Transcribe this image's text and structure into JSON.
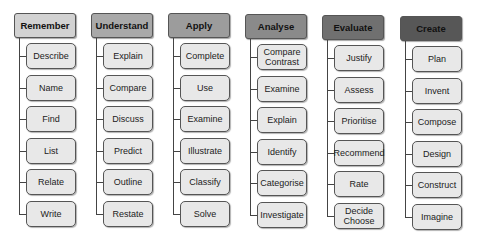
{
  "diagram": {
    "type": "hierarchy",
    "columns": [
      {
        "title": "Remember",
        "color": "#d2d2d2",
        "x": 14,
        "y": 13,
        "items": [
          "Describe",
          "Name",
          "Find",
          "List",
          "Relate",
          "Write"
        ]
      },
      {
        "title": "Understand",
        "color": "#a9a9a9",
        "x": 91,
        "y": 13,
        "items": [
          "Explain",
          "Compare",
          "Discuss",
          "Predict",
          "Outline",
          "Restate"
        ]
      },
      {
        "title": "Apply",
        "color": "#9c9c9c",
        "x": 168,
        "y": 13,
        "items": [
          "Complete",
          "Use",
          "Examine",
          "Illustrate",
          "Classify",
          "Solve"
        ]
      },
      {
        "title": "Analyse",
        "color": "#8a8a8a",
        "x": 245,
        "y": 14,
        "items": [
          "Compare\nContrast",
          "Examine",
          "Explain",
          "Identify",
          "Categorise",
          "Investigate"
        ]
      },
      {
        "title": "Evaluate",
        "color": "#707070",
        "x": 322,
        "y": 15,
        "items": [
          "Justify",
          "Assess",
          "Prioritise",
          "Recommend",
          "Rate",
          "Decide\nChoose"
        ]
      },
      {
        "title": "Create",
        "color": "#575757",
        "x": 400,
        "y": 16,
        "items": [
          "Plan",
          "Invent",
          "Compose",
          "Design",
          "Construct",
          "Imagine"
        ]
      }
    ]
  }
}
